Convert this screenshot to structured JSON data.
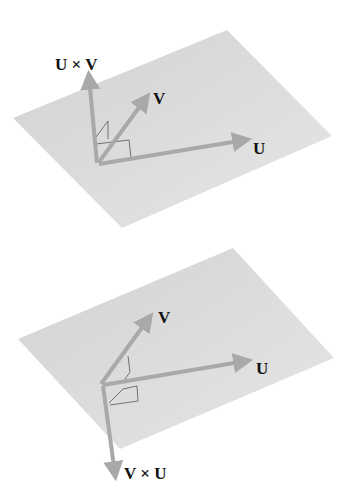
{
  "colors": {
    "plane": "#d6d6d6",
    "plane_edge": "#cfcfcf",
    "vector": "#a9a9a9",
    "right_angle_mark": "#555555",
    "label": "#111111"
  },
  "panels": [
    {
      "name": "top",
      "plane": {
        "points": "13,118 227,30 332,136 122,228"
      },
      "origin": [
        97,
        163
      ],
      "vectors": [
        {
          "id": "u_cross_v",
          "tip": [
            89,
            75
          ],
          "label": "U × V",
          "label_pos": [
            55,
            70
          ]
        },
        {
          "id": "v",
          "tip": [
            147,
            96
          ],
          "label": "V",
          "label_pos": [
            153,
            103
          ]
        },
        {
          "id": "u",
          "tip": [
            247,
            140
          ],
          "label": "U",
          "label_pos": [
            253,
            154
          ]
        }
      ]
    },
    {
      "name": "bottom",
      "plane": {
        "points": "18,339 233,248 334,358 120,449"
      },
      "origin": [
        101,
        384
      ],
      "vectors": [
        {
          "id": "v",
          "tip": [
            151,
            316
          ],
          "label": "V",
          "label_pos": [
            158,
            323
          ]
        },
        {
          "id": "u",
          "tip": [
            248,
            361
          ],
          "label": "U",
          "label_pos": [
            256,
            374
          ]
        },
        {
          "id": "v_cross_u",
          "tip": [
            115,
            480
          ],
          "label": "V × U",
          "label_pos": [
            124,
            479
          ]
        }
      ]
    }
  ],
  "labels": {
    "top_cross": "U × V",
    "top_v": "V",
    "top_u": "U",
    "bottom_v": "V",
    "bottom_u": "U",
    "bottom_cross": "V × U"
  }
}
